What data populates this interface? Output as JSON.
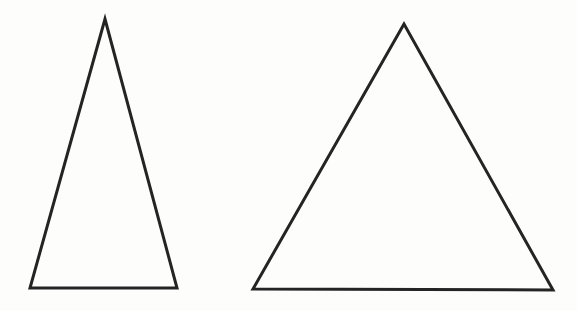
{
  "canvas": {
    "width": "577",
    "height": "311",
    "background_color": "#fdfdfc",
    "viewbox": "0 0 577 311"
  },
  "style": {
    "stroke_color": "#242424",
    "stroke_width": "3"
  },
  "shapes": {
    "left_triangle": {
      "description": "tall narrow isosceles triangle",
      "points": "105,19 30,288 177,288"
    },
    "right_triangle": {
      "description": "wide near-equilateral triangle",
      "points": "404,24 253,289 553,290"
    }
  }
}
